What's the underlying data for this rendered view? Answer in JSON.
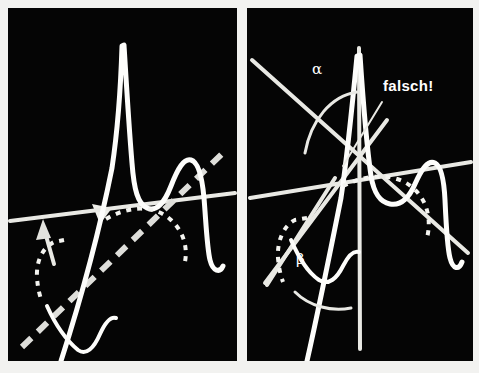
{
  "figure": {
    "kind": "two-panel-line-diagram",
    "background_color": "#f2f2f0",
    "panel_background_color": "#050505",
    "ink_color": "#fdfdfb",
    "panel_count": 2
  },
  "panels": [
    {
      "id": "left",
      "name": "linkes-diagramm",
      "labels": [],
      "elements": [
        "horizontal-line",
        "dashed-diagonal-line",
        "peaked-curve",
        "dotted-arc",
        "dotted-left-arc",
        "up-arrow",
        "angle-wedge"
      ]
    },
    {
      "id": "right",
      "name": "rechtes-diagramm",
      "labels": [
        {
          "key": "alpha",
          "text": "α",
          "x": 312,
          "y": 62
        },
        {
          "key": "beta",
          "text": "β",
          "x": 296,
          "y": 252
        },
        {
          "key": "falsch",
          "text": "falsch!",
          "x": 383,
          "y": 78
        }
      ],
      "elements": [
        "vertical-line",
        "descending-diagonal-line",
        "ascending-diagonal-line",
        "second-descending-line",
        "peaked-curve",
        "dotted-arc",
        "dotted-left-arc",
        "alpha-angle-arc",
        "beta-angle-arc",
        "falsch-pointer-line"
      ]
    }
  ],
  "annotations": {
    "alpha_label": "α",
    "beta_label": "β",
    "falsch_label": "falsch!"
  },
  "colors": {
    "page": "#f2f2f0",
    "panel": "#050505",
    "line": "#e9e9e4",
    "curve": "#fdfdfb",
    "dashed": "#dededa",
    "dotted": "#f4f4f0",
    "text": "#ffffff"
  }
}
